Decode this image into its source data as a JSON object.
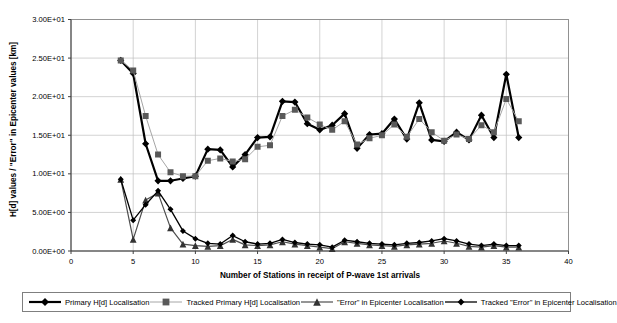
{
  "chart_data": {
    "type": "line",
    "title": "",
    "xlabel": "Number of Stations in receipt of P-wave 1st arrivals",
    "ylabel": "H[d] values / \"Error\" in Epicenter values [km]",
    "xlim": [
      0,
      40
    ],
    "ylim": [
      0,
      30
    ],
    "grid": "both",
    "legend_position": "bottom",
    "xticks": [
      0,
      5,
      10,
      15,
      20,
      25,
      30,
      35,
      40
    ],
    "yticks": [
      {
        "value": 0,
        "label": "0.00E+00"
      },
      {
        "value": 5,
        "label": "5.00E+00"
      },
      {
        "value": 10,
        "label": "1.00E+01"
      },
      {
        "value": 15,
        "label": "1.50E+01"
      },
      {
        "value": 20,
        "label": "2.00E+01"
      },
      {
        "value": 25,
        "label": "2.50E+01"
      },
      {
        "value": 30,
        "label": "3.00E+01"
      }
    ],
    "x": [
      4,
      5,
      6,
      7,
      8,
      9,
      10,
      11,
      12,
      13,
      14,
      15,
      16,
      17,
      18,
      19,
      20,
      21,
      22,
      23,
      24,
      25,
      26,
      27,
      28,
      29,
      30,
      31,
      32,
      33,
      34,
      35,
      36
    ],
    "series": [
      {
        "name": "Primary H[d] Localisation",
        "marker": "diamond",
        "marker_size": 3.6,
        "color": "#000000",
        "line_color": "#000000",
        "line_width": 2.2,
        "values": [
          24.7,
          23.0,
          13.9,
          9.1,
          9.1,
          9.4,
          9.7,
          13.2,
          13.1,
          10.9,
          12.5,
          14.7,
          14.8,
          19.4,
          19.3,
          16.5,
          15.7,
          16.3,
          17.8,
          13.3,
          15.1,
          15.2,
          17.1,
          14.5,
          19.2,
          14.4,
          14.2,
          15.4,
          14.4,
          17.6,
          14.7,
          22.9,
          14.7
        ]
      },
      {
        "name": "Tracked Primary H[d] Localisation",
        "marker": "square",
        "marker_size": 3.0,
        "color": "#595959",
        "line_color": "#a6a6a6",
        "line_width": 1.0,
        "values": [
          24.7,
          23.4,
          17.5,
          12.5,
          10.2,
          9.7,
          9.7,
          11.7,
          12.0,
          11.6,
          11.9,
          13.5,
          13.7,
          17.5,
          18.3,
          17.3,
          16.4,
          15.7,
          16.8,
          13.8,
          14.6,
          15.0,
          16.4,
          14.8,
          17.1,
          15.4,
          14.3,
          15.1,
          14.5,
          16.3,
          15.4,
          19.7,
          16.8
        ]
      },
      {
        "name": "\"Error\" in Epicenter Localisation",
        "marker": "triangle",
        "marker_size": 3.4,
        "color": "#333333",
        "line_color": "#4d4d4d",
        "line_width": 1.2,
        "values": [
          9.3,
          1.5,
          6.6,
          7.5,
          3.0,
          0.9,
          0.7,
          0.6,
          0.7,
          1.5,
          0.8,
          0.7,
          0.8,
          1.2,
          0.9,
          0.7,
          0.5,
          0.3,
          1.2,
          1.0,
          0.8,
          0.7,
          0.6,
          0.8,
          0.9,
          1.0,
          1.3,
          1.0,
          0.6,
          0.5,
          0.7,
          0.5,
          0.5
        ]
      },
      {
        "name": "Tracked \"Error\" in Epicenter Localisation",
        "marker": "diamond",
        "marker_size": 3.0,
        "color": "#000000",
        "line_color": "#000000",
        "line_width": 1.3,
        "values": [
          9.3,
          4.0,
          6.0,
          7.8,
          5.4,
          2.6,
          1.6,
          1.0,
          0.9,
          2.0,
          1.2,
          0.9,
          1.0,
          1.5,
          1.1,
          0.9,
          0.8,
          0.5,
          1.4,
          1.2,
          1.0,
          0.9,
          0.8,
          1.0,
          1.1,
          1.3,
          1.6,
          1.3,
          0.9,
          0.7,
          0.9,
          0.7,
          0.7
        ]
      }
    ],
    "colors": {
      "gridline": "#c0c0c0",
      "frame": "#808080",
      "axis": "#404040",
      "background": "#ffffff"
    }
  }
}
